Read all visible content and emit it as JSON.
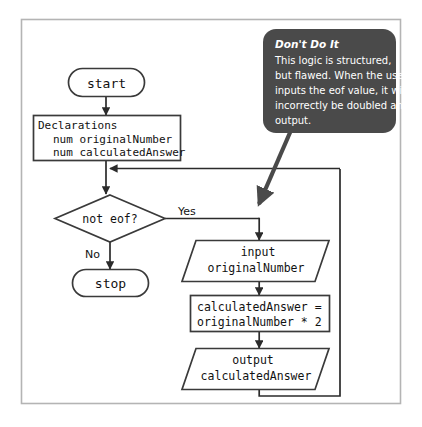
{
  "figure": {
    "background_color": "#ffffff",
    "border_color": "#b4b4b4",
    "shape_stroke_color": "#3a3a3a",
    "shape_fill_color": "#ffffff",
    "connector_color": "#2b2b2b",
    "callout_fill_color": "#4a4a4a",
    "callout_text_color": "#ffffff"
  },
  "nodes": {
    "start": {
      "type": "terminator",
      "label": "start"
    },
    "declarations": {
      "type": "process",
      "line1": "Declarations",
      "line2": "num originalNumber",
      "line3": "num calculatedAnswer"
    },
    "decision": {
      "type": "decision",
      "label": "not eof?"
    },
    "stop": {
      "type": "terminator",
      "label": "stop"
    },
    "input": {
      "type": "input-output",
      "line1": "input",
      "line2": "originalNumber"
    },
    "process": {
      "type": "process",
      "line1": "calculatedAnswer =",
      "line2": "originalNumber * 2"
    },
    "output": {
      "type": "input-output",
      "line1": "output",
      "line2": "calculatedAnswer"
    }
  },
  "branch_labels": {
    "yes": "Yes",
    "no": "No"
  },
  "callout": {
    "title": "Don't Do It",
    "body_line1": "This logic is structured,",
    "body_line2": "but flawed. When the user",
    "body_line3": "inputs the eof value, it will",
    "body_line4": "incorrectly be doubled and",
    "body_line5": "output."
  }
}
